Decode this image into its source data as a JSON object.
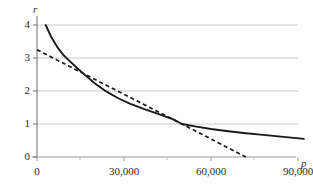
{
  "chart_data": {
    "type": "line",
    "title": "",
    "subtitle": "",
    "xlabel": "p",
    "ylabel": "r",
    "xlim": [
      0,
      96000
    ],
    "ylim": [
      0,
      4.3
    ],
    "grid": "horizontal",
    "legend": "none",
    "x_ticks": [
      0,
      30000,
      60000,
      90000
    ],
    "x_tick_labels": [
      "0",
      "30,000",
      "60,000",
      "90,000"
    ],
    "x_minor_ticks": [
      15000,
      45000,
      75000
    ],
    "y_ticks": [
      0,
      1,
      2,
      3,
      4
    ],
    "y_tick_labels": [
      "0",
      "1",
      "2",
      "3",
      "4"
    ],
    "series": [
      {
        "name": "curve",
        "style": "solid",
        "color": "#1a1a1a",
        "x": [
          3000,
          5000,
          7000,
          9000,
          11000,
          14000,
          17000,
          20000,
          24000,
          28000,
          32000,
          37000,
          42000,
          47000,
          50000,
          55000,
          60000,
          66000,
          72000,
          78000,
          85000,
          92000
        ],
        "y": [
          4.0,
          3.62,
          3.33,
          3.1,
          2.93,
          2.68,
          2.45,
          2.23,
          1.98,
          1.78,
          1.62,
          1.45,
          1.3,
          1.14,
          1.0,
          0.92,
          0.85,
          0.78,
          0.72,
          0.67,
          0.61,
          0.55
        ]
      },
      {
        "name": "tangent-line",
        "style": "dashed",
        "color": "#1a1a1a",
        "x": [
          0,
          50000,
          72000
        ],
        "y": [
          3.25,
          1.0,
          0.0
        ]
      }
    ],
    "annotations": {
      "tangent_point": {
        "x": 50000,
        "y": 1.0
      },
      "tangent_y_intercept": 3.25,
      "tangent_x_intercept": 72000
    }
  }
}
